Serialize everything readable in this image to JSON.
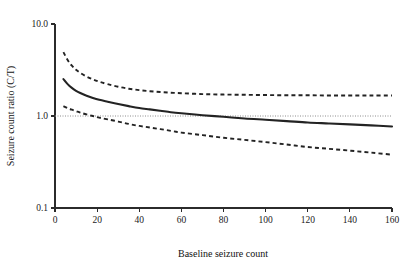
{
  "chart_data": {
    "type": "line",
    "title": "",
    "xlabel": "Baseline seizure count",
    "ylabel": "Seizure count ratio (C/T)",
    "xlim": [
      0,
      160
    ],
    "ylim": [
      0.1,
      10.0
    ],
    "yscale": "log",
    "xscale": "linear",
    "grid": false,
    "legend": null,
    "xticks": [
      0,
      20,
      40,
      60,
      80,
      100,
      120,
      140,
      160
    ],
    "xtick_labels": [
      "0",
      "20",
      "40",
      "60",
      "80",
      "100",
      "120",
      "140",
      "160"
    ],
    "yticks": [
      0.1,
      1.0,
      10.0
    ],
    "ytick_labels": [
      "0.1",
      "1.0",
      "10.0"
    ],
    "annotations": [
      {
        "name": "reference-line",
        "kind": "horizontal-dotted-line",
        "y": 1.0,
        "label": ""
      }
    ],
    "x": [
      4,
      6,
      8,
      10,
      12,
      15,
      18,
      21,
      25,
      30,
      35,
      40,
      45,
      50,
      55,
      60,
      70,
      80,
      90,
      100,
      110,
      120,
      130,
      140,
      150,
      160
    ],
    "series": [
      {
        "name": "Seizure count ratio (C/T)",
        "style": "solid",
        "color": "#232323",
        "values": [
          2.52,
          2.22,
          2.02,
          1.88,
          1.78,
          1.66,
          1.57,
          1.5,
          1.43,
          1.35,
          1.28,
          1.22,
          1.18,
          1.14,
          1.1,
          1.07,
          1.02,
          0.98,
          0.94,
          0.91,
          0.88,
          0.85,
          0.83,
          0.81,
          0.79,
          0.77
        ]
      },
      {
        "name": "Upper confidence limit",
        "style": "dashed",
        "color": "#232323",
        "values": [
          4.95,
          4.05,
          3.52,
          3.18,
          2.94,
          2.68,
          2.5,
          2.36,
          2.22,
          2.08,
          1.98,
          1.91,
          1.86,
          1.82,
          1.79,
          1.77,
          1.73,
          1.71,
          1.7,
          1.69,
          1.68,
          1.68,
          1.67,
          1.67,
          1.67,
          1.67
        ]
      },
      {
        "name": "Lower confidence limit",
        "style": "dashed",
        "color": "#232323",
        "values": [
          1.28,
          1.22,
          1.17,
          1.13,
          1.09,
          1.04,
          1.0,
          0.96,
          0.92,
          0.87,
          0.82,
          0.78,
          0.75,
          0.72,
          0.69,
          0.66,
          0.62,
          0.58,
          0.55,
          0.52,
          0.49,
          0.46,
          0.44,
          0.42,
          0.4,
          0.38
        ]
      }
    ]
  }
}
